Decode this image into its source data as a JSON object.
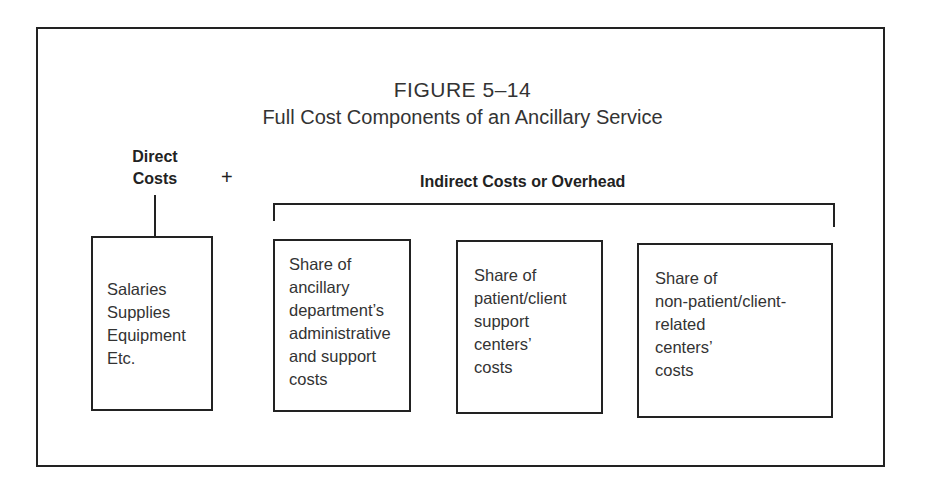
{
  "figure": {
    "number": "FIGURE 5–14",
    "title": "Full Cost Components of an Ancillary Service"
  },
  "direct": {
    "label_lines": [
      "Direct",
      "Costs"
    ],
    "box_lines": [
      "Salaries",
      "Supplies",
      "Equipment",
      "Etc."
    ]
  },
  "operator": "+",
  "indirect": {
    "label": "Indirect Costs or Overhead",
    "boxes": [
      {
        "lines": [
          "Share of",
          "ancillary",
          "department’s",
          "administrative",
          "and support",
          "costs"
        ]
      },
      {
        "lines": [
          "Share of",
          "patient/client",
          "support",
          "centers’",
          "costs"
        ]
      },
      {
        "lines": [
          "Share of",
          "non-patient/client-",
          "related",
          "centers’",
          "costs"
        ]
      }
    ]
  },
  "colors": {
    "line": "#222222",
    "text": "#333333",
    "background": "#ffffff"
  }
}
